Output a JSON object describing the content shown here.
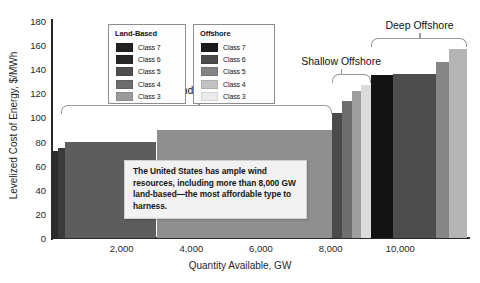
{
  "chart_data": {
    "type": "bar",
    "title": "",
    "xlabel": "Quantity Available, GW",
    "ylabel": "Levelized Cost of Energy, $/MWh",
    "xlim": [
      0,
      12000
    ],
    "ylim": [
      0,
      180
    ],
    "grid": false,
    "x_ticks": [
      "2,000",
      "4,000",
      "6,000",
      "8,000",
      "10,000"
    ],
    "x_tick_values": [
      2000,
      4000,
      6000,
      8000,
      10000
    ],
    "y_ticks": [
      "0",
      "20",
      "40",
      "60",
      "80",
      "100",
      "120",
      "140",
      "160",
      "180"
    ],
    "y_tick_values": [
      0,
      20,
      40,
      60,
      80,
      100,
      120,
      140,
      160,
      180
    ],
    "bars": [
      {
        "group": "land-based",
        "class": "Class 7",
        "x_start": 0,
        "x_end": 170,
        "value": 72,
        "color": "#2b2b2b"
      },
      {
        "group": "land-based",
        "class": "Class 6",
        "x_start": 170,
        "x_end": 380,
        "value": 75,
        "color": "#3a3a3a"
      },
      {
        "group": "land-based",
        "class": "Class 5",
        "x_start": 380,
        "x_end": 3000,
        "value": 80,
        "color": "#5d5d5d"
      },
      {
        "group": "land-based",
        "class": "Class 4",
        "x_start": 3000,
        "x_end": 8050,
        "value": 90,
        "color": "#8f8f8f"
      },
      {
        "group": "shallow-offshore",
        "class": "Class 7",
        "x_start": 8050,
        "x_end": 8330,
        "value": 104,
        "color": "#4a4a4a"
      },
      {
        "group": "shallow-offshore",
        "class": "Class 6",
        "x_start": 8330,
        "x_end": 8620,
        "value": 114,
        "color": "#6e6e6e"
      },
      {
        "group": "shallow-offshore",
        "class": "Class 5",
        "x_start": 8620,
        "x_end": 8880,
        "value": 122,
        "color": "#9e9e9e"
      },
      {
        "group": "shallow-offshore",
        "class": "Class 4",
        "x_start": 8880,
        "x_end": 9150,
        "value": 127,
        "color": "#dcdcdc"
      },
      {
        "group": "deep-offshore",
        "class": "Class 7",
        "x_start": 9150,
        "x_end": 9800,
        "value": 135,
        "color": "#131313"
      },
      {
        "group": "deep-offshore",
        "class": "Class 6",
        "x_start": 9800,
        "x_end": 11030,
        "value": 136,
        "color": "#4d4d4d"
      },
      {
        "group": "deep-offshore",
        "class": "Class 5",
        "x_start": 11030,
        "x_end": 11400,
        "value": 146,
        "color": "#868686"
      },
      {
        "group": "deep-offshore",
        "class": "Class 4",
        "x_start": 11400,
        "x_end": 11900,
        "value": 157,
        "color": "#b4b4b4"
      }
    ],
    "groups": [
      {
        "name": "Land-Based",
        "label_x": 4200,
        "start_x": 250,
        "end_x": 8050,
        "label_y": 122,
        "bracket_y": 110
      },
      {
        "name": "Shallow Offshore",
        "label_x": 8300,
        "start_x": 8050,
        "end_x": 9150,
        "label_y": 146,
        "bracket_y": 136
      },
      {
        "name": "Deep Offshore",
        "label_x": 10550,
        "start_x": 9150,
        "end_x": 11900,
        "label_y": 176,
        "bracket_y": 166
      }
    ],
    "legends": [
      {
        "title": "Land-Based",
        "position": "upper-left-inside",
        "entries": [
          {
            "label": "Class 7",
            "color": "#212121"
          },
          {
            "label": "Class 6",
            "color": "#262626"
          },
          {
            "label": "Class 5",
            "color": "#4e4e4e"
          },
          {
            "label": "Class 4",
            "color": "#6d6d6d"
          },
          {
            "label": "Class 3",
            "color": "#9b9b9b"
          }
        ]
      },
      {
        "title": "Offshore",
        "position": "upper-center-inside",
        "entries": [
          {
            "label": "Class 7",
            "color": "#1b1b1b"
          },
          {
            "label": "Class 6",
            "color": "#4b4b4b"
          },
          {
            "label": "Class 5",
            "color": "#848484"
          },
          {
            "label": "Class 4",
            "color": "#c2c2c2"
          },
          {
            "label": "Class 3",
            "color": "#ececec"
          }
        ]
      }
    ],
    "annotations": [
      {
        "id": "callout",
        "text": "The United States has ample wind resources, including more than 8,000 GW land-based—the most affordable type to harness.",
        "x": 2600,
        "y": 58
      }
    ]
  },
  "colors": {
    "background": "#ffffff",
    "axis": "#2a2a2a",
    "text": "#1a1a1a",
    "bracket": "#9a9a9a",
    "callout_bg": "#f2f2f2",
    "callout_border": "#cfcfcf",
    "legend_border": "#8d8d8d"
  }
}
